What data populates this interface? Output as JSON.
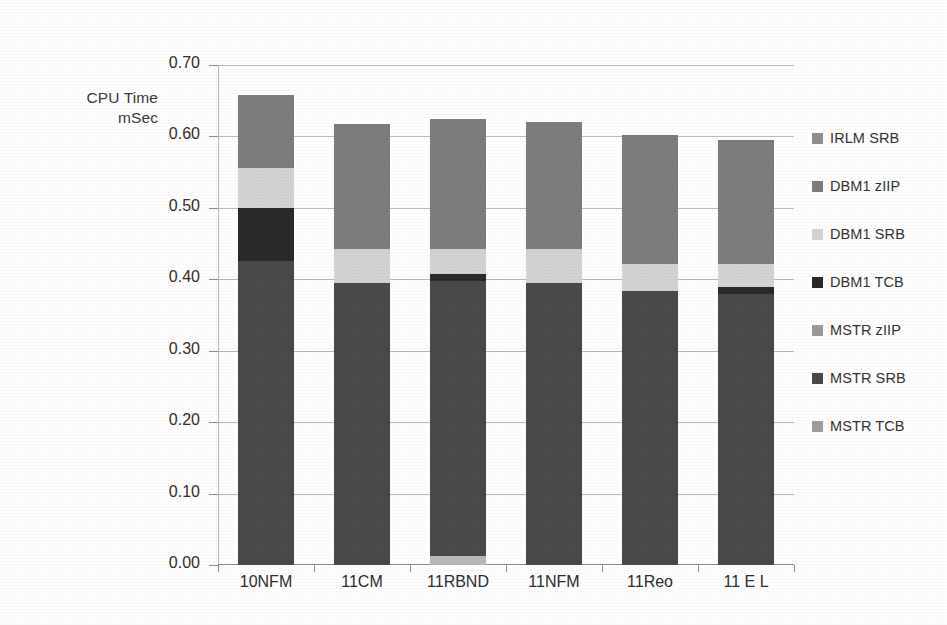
{
  "chart_data": {
    "type": "bar",
    "subtype": "stacked-bar",
    "title": "",
    "ylabel": "CPU Time\nmSec",
    "xlabel": "",
    "ylim": [
      0.0,
      0.7
    ],
    "ytick_step": 0.1,
    "ytick_labels": [
      "0.70",
      "0.60",
      "0.50",
      "0.40",
      "0.30",
      "0.20",
      "0.10",
      "0.00"
    ],
    "ytick_values": [
      0.7,
      0.6,
      0.5,
      0.4,
      0.3,
      0.2,
      0.1,
      0.0
    ],
    "grid": true,
    "legend_position": "right",
    "categories": [
      "10NFM",
      "11CM",
      "11RBND",
      "11NFM",
      "11Reo",
      "11 E L"
    ],
    "series": [
      {
        "name": "MSTR TCB",
        "color": "#b9b9b9",
        "values": [
          0.0,
          0.0,
          0.012,
          0.0,
          0.0,
          0.0
        ]
      },
      {
        "name": "MSTR SRB",
        "color": "#4a4a4a",
        "values": [
          0.425,
          0.395,
          0.385,
          0.395,
          0.383,
          0.379
        ]
      },
      {
        "name": "MSTR zIIP",
        "color": "#9a9a9a",
        "values": [
          0.0,
          0.0,
          0.0,
          0.0,
          0.0,
          0.0
        ]
      },
      {
        "name": "DBM1 TCB",
        "color": "#2a2a2a",
        "values": [
          0.075,
          0.0,
          0.01,
          0.0,
          0.0,
          0.01
        ]
      },
      {
        "name": "DBM1 SRB",
        "color": "#d4d4d4",
        "values": [
          0.056,
          0.048,
          0.036,
          0.047,
          0.038,
          0.032
        ]
      },
      {
        "name": "DBM1 zIIP",
        "color": "#7d7d7d",
        "values": [
          0.102,
          0.175,
          0.182,
          0.178,
          0.181,
          0.174
        ]
      },
      {
        "name": "IRLM SRB",
        "color": "#8f8f8f",
        "values": [
          0.0,
          0.0,
          0.0,
          0.0,
          0.0,
          0.0
        ]
      }
    ],
    "bar_totals": [
      0.658,
      0.618,
      0.625,
      0.62,
      0.602,
      0.595
    ],
    "legend_order": [
      "IRLM SRB",
      "DBM1 zIIP",
      "DBM1 SRB",
      "DBM1 TCB",
      "MSTR zIIP",
      "MSTR SRB",
      "MSTR TCB"
    ],
    "legend_colors": [
      "#8f8f8f",
      "#7d7d7d",
      "#d4d4d4",
      "#2a2a2a",
      "#9a9a9a",
      "#4a4a4a",
      "#9e9e9e"
    ]
  },
  "axis": {
    "y_title": "CPU Time\nmSec"
  }
}
